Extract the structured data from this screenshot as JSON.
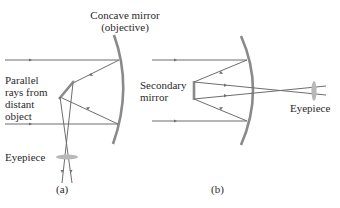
{
  "panel_a": {
    "caption": "(a)",
    "objective_label_line1": "Concave mirror",
    "objective_label_line2": "(objective)",
    "rays_label_line1": "Parallel",
    "rays_label_line2": "rays from",
    "rays_label_line3": "distant",
    "rays_label_line4": "object",
    "eyepiece_label": "Eyepiece"
  },
  "panel_b": {
    "caption": "(b)",
    "secondary_label_line1": "Secondary",
    "secondary_label_line2": "mirror",
    "eyepiece_label": "Eyepiece"
  },
  "colors": {
    "ray": "#6d6d6d",
    "mirror": "#8a8a8a",
    "lens": "#b8b8b8",
    "text": "#2a2a2a"
  }
}
